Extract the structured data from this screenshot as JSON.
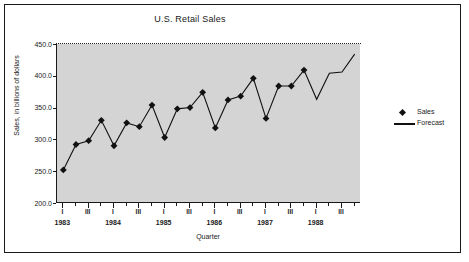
{
  "chart_data": {
    "type": "line",
    "title": "U.S. Retail Sales",
    "xlabel": "Quarter",
    "ylabel": "Sales, in billions of dollars",
    "ylim": [
      200.0,
      450.0
    ],
    "ytick_labels": [
      "450.0",
      "400.0",
      "350.0",
      "300.0",
      "250.0",
      "200.0"
    ],
    "ytick_values": [
      450.0,
      400.0,
      350.0,
      300.0,
      250.0,
      200.0
    ],
    "grid": false,
    "legend_position": "right",
    "years": [
      "1983",
      "1984",
      "1985",
      "1986",
      "1987",
      "1988"
    ],
    "quarter_tick_labels": [
      "I",
      "",
      "III",
      "",
      "I",
      "",
      "III",
      "",
      "I",
      "",
      "III",
      "",
      "I",
      "",
      "III",
      "",
      "I",
      "",
      "III",
      "",
      "I",
      "",
      "III",
      ""
    ],
    "x": [
      "1983 I",
      "1983 II",
      "1983 III",
      "1983 IV",
      "1984 I",
      "1984 II",
      "1984 III",
      "1984 IV",
      "1985 I",
      "1985 II",
      "1985 III",
      "1985 IV",
      "1986 I",
      "1986 II",
      "1986 III",
      "1986 IV",
      "1987 I",
      "1987 II",
      "1987 III",
      "1987 IV",
      "1988 I",
      "1988 II",
      "1988 III",
      "1988 IV"
    ],
    "series": [
      {
        "name": "Sales",
        "marker": "diamond",
        "values": [
          252,
          292,
          298,
          330,
          290,
          326,
          320,
          354,
          303,
          348,
          350,
          374,
          318,
          362,
          368,
          396,
          333,
          384,
          384,
          409,
          null,
          null,
          null,
          null
        ]
      },
      {
        "name": "Forecast",
        "marker": "line",
        "values": [
          252,
          292,
          298,
          330,
          290,
          326,
          320,
          354,
          303,
          348,
          350,
          374,
          318,
          362,
          368,
          396,
          333,
          384,
          384,
          409,
          363,
          404,
          406,
          434
        ]
      }
    ],
    "legend": [
      {
        "label": "Sales",
        "key": "diamond"
      },
      {
        "label": "Forecast",
        "key": "line"
      }
    ]
  }
}
